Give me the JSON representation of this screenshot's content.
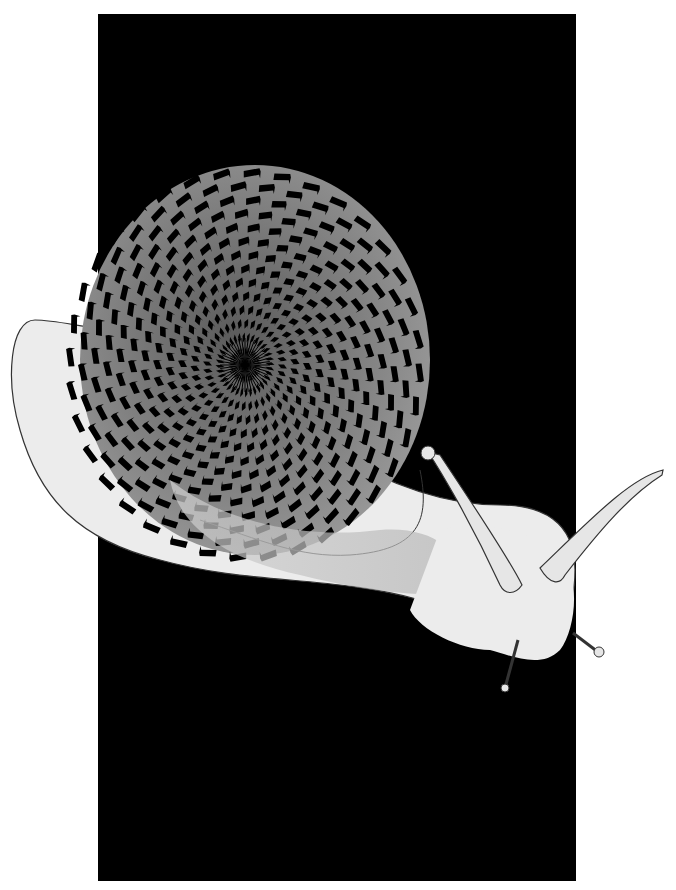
{
  "artwork": {
    "subject": "snail with spiral chevron shell optical illusion",
    "colors": {
      "background": "#ffffff",
      "panel": "#000000",
      "shell_light": "#8a8a8a",
      "shell_dark": "#000000",
      "body": "#ececec",
      "body_shadow": "#b8b8b8",
      "outline": "#333333"
    },
    "panel": {
      "x": 98,
      "y": 14,
      "width": 478,
      "height": 867
    },
    "shell": {
      "cx": 245,
      "cy": 365,
      "rings": 14,
      "segments": 36
    }
  }
}
